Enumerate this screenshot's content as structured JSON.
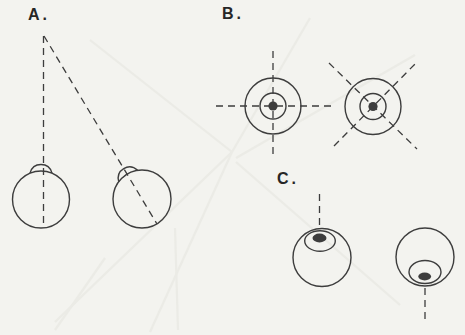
{
  "figure": {
    "background_color": "#f3f3ef",
    "ink_color": "#3d3d3d",
    "label_color": "#262626",
    "artifact_color": "#eaeae4",
    "panels": [
      {
        "id": "A",
        "label": "A."
      },
      {
        "id": "B",
        "label": "B."
      },
      {
        "id": "C",
        "label": "C."
      }
    ]
  }
}
